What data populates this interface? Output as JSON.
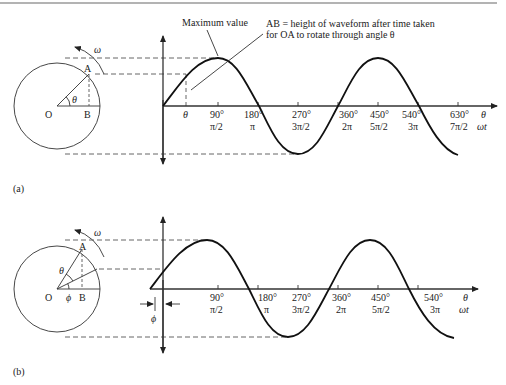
{
  "divider_color": "#9a9a9a",
  "panel_a": {
    "label": "(a)",
    "circle": {
      "O": "O",
      "A": "A",
      "B": "B",
      "theta": "θ",
      "omega": "ω"
    },
    "annotation_max": "Maximum value",
    "annotation_ab_line1": "AB = height of waveform after time taken",
    "annotation_ab_line2": "for OA to rotate through angle θ",
    "theta_tick": "θ",
    "axis_end_1": "θ",
    "axis_end_2": "ωt",
    "ticks": [
      {
        "deg": "90°",
        "rad": "π/2"
      },
      {
        "deg": "180°",
        "rad": "π"
      },
      {
        "deg": "270°",
        "rad": "3π/2"
      },
      {
        "deg": "360°",
        "rad": "2π"
      },
      {
        "deg": "450°",
        "rad": "5π/2"
      },
      {
        "deg": "540°",
        "rad": "3π"
      },
      {
        "deg": "630°",
        "rad": "7π/2"
      }
    ]
  },
  "panel_b": {
    "label": "(b)",
    "circle": {
      "O": "O",
      "A": "A",
      "B": "B",
      "theta": "θ",
      "phi": "ϕ",
      "omega": "ω"
    },
    "phase_label": "ϕ",
    "axis_end_1": "θ",
    "axis_end_2": "ωt",
    "ticks": [
      {
        "deg": "90°",
        "rad": "π/2"
      },
      {
        "deg": "180°",
        "rad": "π"
      },
      {
        "deg": "270°",
        "rad": "3π/2"
      },
      {
        "deg": "360°",
        "rad": "2π"
      },
      {
        "deg": "450°",
        "rad": "5π/2"
      },
      {
        "deg": "540°",
        "rad": "3π"
      }
    ]
  }
}
